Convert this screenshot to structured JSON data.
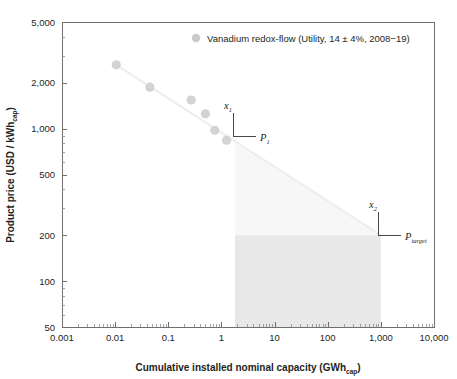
{
  "chart_data": {
    "type": "scatter",
    "title": "",
    "xlabel": "Cumulative installed nominal capacity (GWh",
    "xlabel_sub": "cap",
    "xlabel_tail": ")",
    "ylabel": "Product price (USD / kWh",
    "ylabel_sub": "cap",
    "ylabel_tail": ")",
    "xscale": "log",
    "yscale": "log",
    "xlim": [
      0.001,
      10000
    ],
    "ylim": [
      50,
      5000
    ],
    "grid": false,
    "legend_position": "top-right",
    "xticks": [
      "0.001",
      "0.01",
      "0.1",
      "1",
      "10",
      "100",
      "1,000",
      "10,000"
    ],
    "xtick_values": [
      0.001,
      0.01,
      0.1,
      1,
      10,
      100,
      1000,
      10000
    ],
    "yticks": [
      "5,000",
      "2,000",
      "1,000",
      "500",
      "200",
      "100",
      "50"
    ],
    "ytick_values": [
      5000,
      2000,
      1000,
      500,
      200,
      100,
      50
    ],
    "series": [
      {
        "name": "Vanadium redox-flow (Utility, 14 ± 4%, 2008−19)",
        "marker": "circle",
        "color": "#d3d3d3",
        "x": [
          0.0105,
          0.045,
          0.27,
          0.5,
          0.75,
          1.25
        ],
        "y": [
          2620,
          1870,
          1540,
          1250,
          975,
          840
        ]
      }
    ],
    "trend_line": {
      "name": "experience curve",
      "color": "#eeeeee",
      "x": [
        0.0105,
        1000
      ],
      "y": [
        2620,
        200
      ]
    },
    "shaded_regions": [
      {
        "name": "price-above-target-wedge",
        "color": "#f7f7f7",
        "description": "triangular region between experience curve and P_target from x1 to x2"
      },
      {
        "name": "target-price-block",
        "color": "#e8e8e8",
        "description": "rectangle below P_target from x1 to x2"
      }
    ],
    "annotations": [
      {
        "name": "x1",
        "label": "x",
        "sub": "1",
        "x": 1.8,
        "axis": "x"
      },
      {
        "name": "P1",
        "label": "P",
        "sub": "1",
        "y": 830,
        "axis": "y"
      },
      {
        "name": "x2",
        "label": "x",
        "sub": "2",
        "x": 1000,
        "axis": "x"
      },
      {
        "name": "Ptarget",
        "label": "P",
        "sub": "target",
        "y": 200,
        "axis": "y"
      }
    ]
  },
  "legend": {
    "entries": [
      {
        "marker_name": "legend-marker-vanadium",
        "label": "Vanadium redox-flow (Utility, 14 ± 4%, 2008−19)",
        "color": "#c9c9c9"
      }
    ]
  },
  "axes": {
    "x_title_main": "Cumulative installed nominal capacity (GWh",
    "x_title_sub": "cap",
    "x_title_tail": ")",
    "y_title_main": "Product price (USD / kWh",
    "y_title_sub": "cap",
    "y_title_tail": ")"
  },
  "annotation_labels": {
    "x1_main": "x",
    "x1_sub": "1",
    "p1_main": "P",
    "p1_sub": "1",
    "x2_main": "x",
    "x2_sub": "2",
    "ptarget_main": "P",
    "ptarget_sub": "target"
  },
  "colors": {
    "marker": "#d3d3d3",
    "trend": "#eeeeee",
    "wedge": "#f7f7f7",
    "block": "#e8e8e8",
    "axis": "#6f6f6f",
    "text": "#231f20"
  }
}
